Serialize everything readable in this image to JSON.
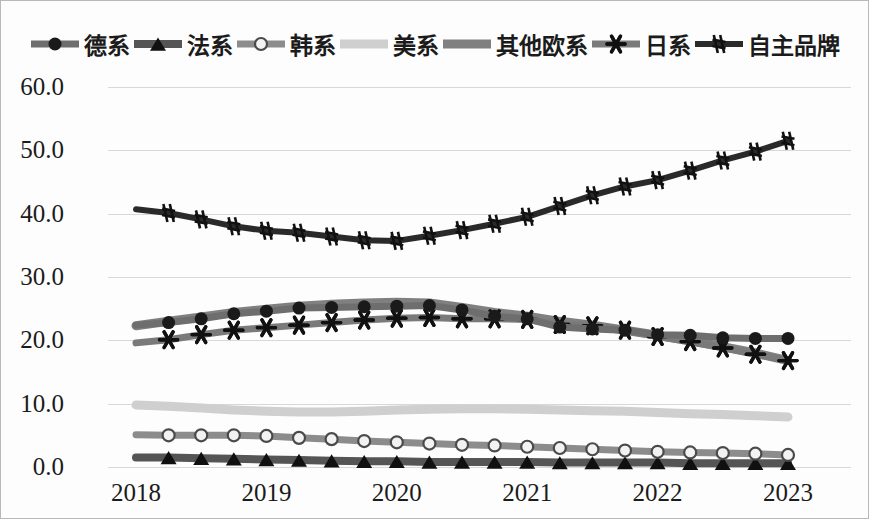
{
  "chart_data": {
    "type": "line",
    "title": "",
    "xlabel": "",
    "ylabel": "",
    "ylim": [
      0.0,
      60.0
    ],
    "y_ticks": [
      "0.0",
      "10.0",
      "20.0",
      "30.0",
      "40.0",
      "50.0",
      "60.0"
    ],
    "x_ticks": [
      "2018",
      "2019",
      "2020",
      "2021",
      "2022",
      "2023"
    ],
    "x": [
      2018.0,
      2018.25,
      2018.5,
      2018.75,
      2019.0,
      2019.25,
      2019.5,
      2019.75,
      2020.0,
      2020.25,
      2020.5,
      2020.75,
      2021.0,
      2021.25,
      2021.5,
      2021.75,
      2022.0,
      2022.25,
      2022.5,
      2022.75,
      2023.0
    ],
    "grid": true,
    "legend_position": "top",
    "series": [
      {
        "name": "德系",
        "marker": "circle",
        "color": "#6e6e6e",
        "marker_color": "#1a1a1a",
        "values": [
          22.4,
          22.8,
          23.4,
          24.2,
          24.6,
          25.1,
          25.2,
          25.3,
          25.4,
          25.5,
          24.8,
          23.8,
          23.4,
          22.1,
          21.8,
          21.6,
          20.9,
          20.8,
          20.4,
          20.3,
          20.3
        ]
      },
      {
        "name": "法系",
        "marker": "triangle",
        "color": "#555555",
        "marker_color": "#101010",
        "values": [
          1.5,
          1.5,
          1.4,
          1.3,
          1.2,
          1.1,
          1.0,
          0.9,
          0.9,
          0.8,
          0.8,
          0.8,
          0.8,
          0.7,
          0.7,
          0.7,
          0.7,
          0.6,
          0.6,
          0.6,
          0.6
        ]
      },
      {
        "name": "韩系",
        "marker": "open-circle",
        "color": "#8c8c8c",
        "marker_color": "#9a9a9a",
        "values": [
          5.1,
          5.0,
          5.0,
          5.0,
          4.9,
          4.6,
          4.4,
          4.1,
          3.9,
          3.7,
          3.5,
          3.4,
          3.2,
          3.0,
          2.8,
          2.6,
          2.4,
          2.3,
          2.2,
          2.1,
          1.9
        ]
      },
      {
        "name": "美系",
        "marker": "none",
        "color": "#cfcfcf",
        "marker_color": "#cfcfcf",
        "values": [
          9.8,
          9.6,
          9.3,
          9.0,
          8.8,
          8.7,
          8.7,
          8.8,
          9.0,
          9.1,
          9.2,
          9.2,
          9.1,
          9.0,
          8.9,
          8.8,
          8.6,
          8.4,
          8.3,
          8.1,
          7.9
        ]
      },
      {
        "name": "其他欧系",
        "marker": "none",
        "color": "#808080",
        "marker_color": "#808080",
        "values": [
          22.3,
          23.0,
          23.7,
          24.4,
          24.9,
          25.4,
          25.7,
          25.9,
          26.0,
          25.9,
          25.2,
          24.4,
          23.8,
          23.0,
          22.4,
          21.6,
          20.8,
          19.9,
          19.0,
          18.0,
          16.8
        ]
      },
      {
        "name": "日系",
        "marker": "asterisk",
        "color": "#7a7a7a",
        "marker_color": "#111111",
        "values": [
          19.6,
          20.1,
          20.9,
          21.6,
          22.0,
          22.4,
          22.8,
          23.2,
          23.5,
          23.6,
          23.4,
          23.4,
          23.3,
          22.5,
          22.3,
          21.6,
          20.6,
          19.8,
          18.8,
          17.8,
          16.8
        ]
      },
      {
        "name": "自主品牌",
        "marker": "hash",
        "color": "#2a2a2a",
        "marker_color": "#111111",
        "values": [
          40.7,
          40.1,
          39.1,
          38.0,
          37.3,
          37.0,
          36.4,
          35.8,
          35.7,
          36.5,
          37.4,
          38.4,
          39.5,
          41.2,
          42.9,
          44.3,
          45.3,
          46.8,
          48.4,
          49.8,
          51.5
        ]
      }
    ]
  }
}
